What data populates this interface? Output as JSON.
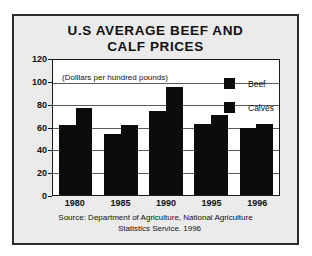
{
  "chart_data": {
    "type": "bar",
    "title": "U.S AVERAGE BEEF AND CALF PRICES",
    "title_line1": "U.S AVERAGE BEEF AND",
    "title_line2": "CALF PRICES",
    "annotation": "(Dolllars per hundred pounds)",
    "categories": [
      "1980",
      "1985",
      "1990",
      "1995",
      "1996"
    ],
    "series": [
      {
        "name": "Beef",
        "values": [
          62,
          54,
          75,
          63,
          60
        ],
        "color": "#0c0c0c"
      },
      {
        "name": "Calves",
        "values": [
          77,
          62,
          96,
          71,
          63
        ],
        "color": "#0c0c0c"
      }
    ],
    "xlabel": "",
    "ylabel": "",
    "ylim": [
      0,
      120
    ],
    "yticks": [
      0,
      20,
      40,
      60,
      80,
      100,
      120
    ],
    "ytick_labels": [
      "0",
      "20",
      "40",
      "60",
      "80",
      "100",
      "120"
    ],
    "grid": true,
    "legend_position": "upper right",
    "source_line1": "Source:  Department of Agriculture, National Agriculture",
    "source_line2": "Statistics Service. 1996"
  },
  "colors": {
    "figure_background": "#ebebeb",
    "plot_background": "#ffffff",
    "border": "#2b2b2b",
    "bar": "#0c0c0c",
    "grid": "#5a5a5a",
    "text": "#111111"
  }
}
